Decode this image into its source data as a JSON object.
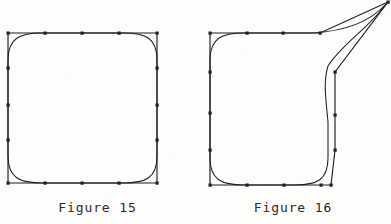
{
  "page": {
    "width": 391,
    "height": 224,
    "background_color": "#fdfdfc",
    "ink_color": "#1f1f1f"
  },
  "figures": [
    {
      "id": "figure-15",
      "caption": "Figure 15",
      "description": "Closed cubic B-spline curve with its square control polygon; all twelve control points lie on a square, producing a rounded-square curve.",
      "polygon_color": "#1f1f1f",
      "curve_color": "#1f1f1f",
      "marker_shape": "square",
      "marker_size": 3,
      "control_polygon": [
        [
          8,
          33
        ],
        [
          45,
          33
        ],
        [
          82,
          33
        ],
        [
          119,
          33
        ],
        [
          157,
          33
        ],
        [
          157,
          68
        ],
        [
          157,
          105
        ],
        [
          157,
          140
        ],
        [
          157,
          183
        ],
        [
          119,
          183
        ],
        [
          82,
          183
        ],
        [
          45,
          183
        ],
        [
          8,
          183
        ],
        [
          8,
          140
        ],
        [
          8,
          105
        ],
        [
          8,
          68
        ]
      ],
      "control_points": [
        [
          8,
          33
        ],
        [
          45,
          33
        ],
        [
          82,
          33
        ],
        [
          119,
          33
        ],
        [
          157,
          33
        ],
        [
          157,
          68
        ],
        [
          157,
          105
        ],
        [
          157,
          140
        ],
        [
          157,
          183
        ],
        [
          119,
          183
        ],
        [
          82,
          183
        ],
        [
          45,
          183
        ],
        [
          8,
          183
        ],
        [
          8,
          140
        ],
        [
          8,
          105
        ],
        [
          8,
          68
        ]
      ]
    },
    {
      "id": "figure-16",
      "caption": "Figure 16",
      "description": "The same closed cubic B-spline as Figure 15 but with one control point displaced far to the upper right, pulling the curve into a sharp spike or horn that leaves the frame.",
      "polygon_color": "#1f1f1f",
      "curve_color": "#1f1f1f",
      "marker_shape": "square",
      "marker_size": 3,
      "displaced_point_index": 4,
      "displaced_point": [
        193,
        2
      ],
      "control_polygon": [
        [
          15,
          33
        ],
        [
          52,
          33
        ],
        [
          88,
          33
        ],
        [
          125,
          33
        ],
        [
          193,
          2
        ],
        [
          140,
          72
        ],
        [
          140,
          115
        ],
        [
          140,
          150
        ],
        [
          136,
          185
        ],
        [
          126,
          185
        ],
        [
          89,
          185
        ],
        [
          52,
          185
        ],
        [
          15,
          185
        ],
        [
          15,
          150
        ],
        [
          15,
          113
        ],
        [
          15,
          72
        ]
      ],
      "control_points": [
        [
          15,
          33
        ],
        [
          52,
          33
        ],
        [
          88,
          33
        ],
        [
          125,
          33
        ],
        [
          193,
          2
        ],
        [
          140,
          72
        ],
        [
          140,
          115
        ],
        [
          140,
          150
        ],
        [
          136,
          185
        ],
        [
          126,
          185
        ],
        [
          89,
          185
        ],
        [
          52,
          185
        ],
        [
          15,
          185
        ],
        [
          15,
          150
        ],
        [
          15,
          113
        ],
        [
          15,
          72
        ]
      ]
    }
  ]
}
